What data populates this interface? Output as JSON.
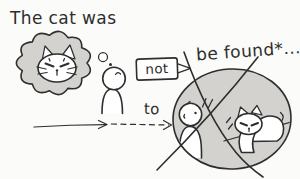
{
  "sentence": {
    "part1": "The cat was",
    "negation": "not",
    "infinitive": "to",
    "part2": "be found*..."
  },
  "figures": [
    "thought-cloud",
    "grumpy-cat-face",
    "thinking-person",
    "walking-arrow-solid",
    "walking-arrow-dashed",
    "not-callout",
    "crossed-out-circle",
    "searching-person",
    "found-cat",
    "prohibition-cross"
  ],
  "colors": {
    "ink": "#2e2e2e",
    "paper": "#fbfbf9",
    "shade": "#d3d2cf",
    "white": "#ffffff"
  }
}
